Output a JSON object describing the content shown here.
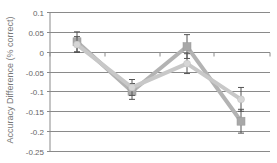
{
  "chart_data": {
    "type": "line",
    "title": "",
    "xlabel": "",
    "ylabel": "Accuracy Difference (% correct)",
    "ylim": [
      -0.25,
      0.1
    ],
    "yticks": [
      0.1,
      0.05,
      0,
      -0.05,
      -0.1,
      -0.15,
      -0.2,
      -0.25
    ],
    "ytick_labels": [
      "0.1",
      "0.05",
      "0",
      "-0.05",
      "-0.1",
      "-0.15",
      "-0.2",
      "-0.25"
    ],
    "grid": true,
    "legend": null,
    "categories": [
      "1",
      "2",
      "3",
      "4"
    ],
    "series": [
      {
        "name": "Series A (square markers)",
        "marker": "square",
        "color": "#b3b3b3",
        "values": [
          0.025,
          -0.1,
          0.013,
          -0.175
        ],
        "error": [
          0.025,
          0.02,
          0.03,
          0.03
        ]
      },
      {
        "name": "Series B (circle markers)",
        "marker": "circle",
        "color": "#c8c8c8",
        "values": [
          0.018,
          -0.09,
          -0.03,
          -0.12
        ],
        "error": [
          0.02,
          0.02,
          0.025,
          0.03
        ]
      }
    ]
  },
  "axis": {
    "ylabel": "Accuracy Difference (% correct)",
    "tick_labels": [
      "0.1",
      "0.05",
      "0",
      "-0.05",
      "-0.1",
      "-0.15",
      "-0.2",
      "-0.25"
    ]
  },
  "colors": {
    "gridline": "#8a8a8a",
    "series_a": "#b3b3b3",
    "series_b": "#c8c8c8",
    "errorbar": "#555555"
  }
}
